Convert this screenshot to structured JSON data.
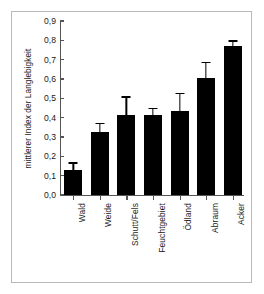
{
  "chart_data": {
    "type": "bar",
    "title": "",
    "xlabel": "",
    "ylabel": "mittlerer Index der Langlebigkeit",
    "categories": [
      "Wald",
      "Weide",
      "Schutt/Fels",
      "Feuchtgebiet",
      "Ödland",
      "Abraum",
      "Acker"
    ],
    "values": [
      0.13,
      0.325,
      0.415,
      0.415,
      0.435,
      0.605,
      0.77
    ],
    "errors": [
      0.04,
      0.05,
      0.095,
      0.035,
      0.095,
      0.085,
      0.03
    ],
    "ylim": [
      0.0,
      0.9
    ],
    "ytick_labels": [
      "0,0",
      "0,1",
      "0,2",
      "0,3",
      "0,4",
      "0,5",
      "0,6",
      "0,7",
      "0,8",
      "0,9"
    ],
    "ytick_values": [
      0.0,
      0.1,
      0.2,
      0.3,
      0.4,
      0.5,
      0.6,
      0.7,
      0.8,
      0.9
    ],
    "grid": false,
    "legend": false,
    "bar_color": "#000000",
    "axis_color": "#555555",
    "frame_color": "#b9b9b9",
    "error_bar_type": "symmetric"
  }
}
